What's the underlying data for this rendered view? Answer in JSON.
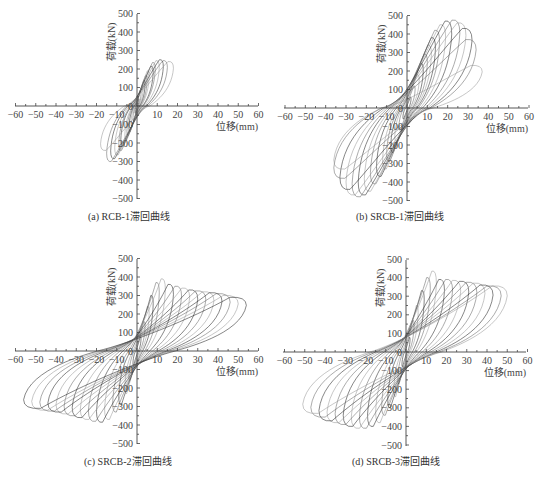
{
  "figure": {
    "captions": [
      "(a) RCB-1滞回曲线",
      "(b) SRCB-1滞回曲线",
      "(c)  SRCB-2滞回曲线",
      "(d) SRCB-3滞回曲线"
    ]
  },
  "chart_data": [
    {
      "type": "line",
      "title": "(a) RCB-1滞回曲线",
      "xlabel": "位移(mm)",
      "ylabel": "荷载(kN)",
      "xlim": [
        -60,
        60
      ],
      "ylim": [
        -500,
        500
      ],
      "xticks": [
        -60,
        -50,
        -40,
        -30,
        -20,
        -10,
        10,
        20,
        30,
        40,
        50,
        60
      ],
      "yticks": [
        -500,
        -400,
        -300,
        -200,
        -100,
        0,
        100,
        200,
        300,
        400,
        500
      ],
      "grid": false,
      "legend": "none",
      "series": [
        {
          "name": "hysteresis",
          "cycles": [
            {
              "dpos": 1,
              "ppos": 40,
              "dneg": -1,
              "pneg": -40
            },
            {
              "dpos": 2,
              "ppos": 80,
              "dneg": -2,
              "pneg": -80
            },
            {
              "dpos": 3,
              "ppos": 110,
              "dneg": -3,
              "pneg": -110
            },
            {
              "dpos": 4,
              "ppos": 140,
              "dneg": -4,
              "pneg": -140
            },
            {
              "dpos": 5,
              "ppos": 165,
              "dneg": -5,
              "pneg": -160
            },
            {
              "dpos": 6,
              "ppos": 190,
              "dneg": -6,
              "pneg": -185
            },
            {
              "dpos": 8,
              "ppos": 215,
              "dneg": -8,
              "pneg": -215
            },
            {
              "dpos": 9,
              "ppos": 235,
              "dneg": -9,
              "pneg": -240
            },
            {
              "dpos": 11,
              "ppos": 245,
              "dneg": -11,
              "pneg": -265
            },
            {
              "dpos": 13,
              "ppos": 250,
              "dneg": -13,
              "pneg": -285
            },
            {
              "dpos": 15,
              "ppos": 245,
              "dneg": -15,
              "pneg": -300
            },
            {
              "dpos": 18,
              "ppos": 240,
              "dneg": -18,
              "pneg": -240
            }
          ]
        }
      ]
    },
    {
      "type": "line",
      "title": "(b) SRCB-1滞回曲线",
      "xlabel": "位移(mm)",
      "ylabel": "荷载(kN)",
      "xlim": [
        -60,
        60
      ],
      "ylim": [
        -500,
        500
      ],
      "xticks": [
        -60,
        -50,
        -40,
        -30,
        -20,
        -10,
        10,
        20,
        30,
        40,
        50,
        60
      ],
      "yticks": [
        -500,
        -400,
        -300,
        -200,
        -100,
        0,
        100,
        200,
        300,
        400,
        500
      ],
      "grid": false,
      "legend": "none",
      "series": [
        {
          "name": "hysteresis",
          "cycles": [
            {
              "dpos": 2,
              "ppos": 60,
              "dneg": -2,
              "pneg": -60
            },
            {
              "dpos": 4,
              "ppos": 120,
              "dneg": -4,
              "pneg": -120
            },
            {
              "dpos": 6,
              "ppos": 180,
              "dneg": -6,
              "pneg": -180
            },
            {
              "dpos": 8,
              "ppos": 240,
              "dneg": -8,
              "pneg": -240
            },
            {
              "dpos": 10,
              "ppos": 290,
              "dneg": -10,
              "pneg": -290
            },
            {
              "dpos": 12,
              "ppos": 340,
              "dneg": -12,
              "pneg": -330
            },
            {
              "dpos": 14,
              "ppos": 380,
              "dneg": -15,
              "pneg": -370
            },
            {
              "dpos": 16,
              "ppos": 420,
              "dneg": -18,
              "pneg": -410
            },
            {
              "dpos": 19,
              "ppos": 450,
              "dneg": -21,
              "pneg": -450
            },
            {
              "dpos": 22,
              "ppos": 470,
              "dneg": -24,
              "pneg": -470
            },
            {
              "dpos": 26,
              "ppos": 475,
              "dneg": -27,
              "pneg": -480
            },
            {
              "dpos": 29,
              "ppos": 460,
              "dneg": -30,
              "pneg": -470
            },
            {
              "dpos": 32,
              "ppos": 430,
              "dneg": -33,
              "pneg": -440
            },
            {
              "dpos": 34,
              "ppos": 370,
              "dneg": -36,
              "pneg": -380
            },
            {
              "dpos": 37,
              "ppos": 230,
              "dneg": -36,
              "pneg": -330
            }
          ]
        }
      ]
    },
    {
      "type": "line",
      "title": "(c)  SRCB-2滞回曲线",
      "xlabel": "位移(mm)",
      "ylabel": "荷载(kN)",
      "xlim": [
        -60,
        60
      ],
      "ylim": [
        -500,
        500
      ],
      "xticks": [
        -60,
        -50,
        -40,
        -30,
        -20,
        -10,
        10,
        20,
        30,
        40,
        50,
        60
      ],
      "yticks": [
        -500,
        -400,
        -300,
        -200,
        -100,
        0,
        100,
        200,
        300,
        400,
        500
      ],
      "grid": false,
      "legend": "none",
      "series": [
        {
          "name": "hysteresis",
          "cycles": [
            {
              "dpos": 2,
              "ppos": 80,
              "dneg": -2,
              "pneg": -80
            },
            {
              "dpos": 4,
              "ppos": 160,
              "dneg": -4,
              "pneg": -160
            },
            {
              "dpos": 6,
              "ppos": 240,
              "dneg": -6,
              "pneg": -230
            },
            {
              "dpos": 8,
              "ppos": 300,
              "dneg": -9,
              "pneg": -290
            },
            {
              "dpos": 11,
              "ppos": 370,
              "dneg": -12,
              "pneg": -330
            },
            {
              "dpos": 14,
              "ppos": 390,
              "dneg": -16,
              "pneg": -370
            },
            {
              "dpos": 18,
              "ppos": 360,
              "dneg": -20,
              "pneg": -385
            },
            {
              "dpos": 22,
              "ppos": 350,
              "dneg": -24,
              "pneg": -380
            },
            {
              "dpos": 26,
              "ppos": 340,
              "dneg": -28,
              "pneg": -370
            },
            {
              "dpos": 30,
              "ppos": 330,
              "dneg": -32,
              "pneg": -360
            },
            {
              "dpos": 34,
              "ppos": 325,
              "dneg": -36,
              "pneg": -350
            },
            {
              "dpos": 38,
              "ppos": 320,
              "dneg": -40,
              "pneg": -340
            },
            {
              "dpos": 42,
              "ppos": 315,
              "dneg": -44,
              "pneg": -330
            },
            {
              "dpos": 46,
              "ppos": 310,
              "dneg": -48,
              "pneg": -325
            },
            {
              "dpos": 50,
              "ppos": 300,
              "dneg": -52,
              "pneg": -320
            },
            {
              "dpos": 54,
              "ppos": 290,
              "dneg": -56,
              "pneg": -310
            }
          ]
        }
      ]
    },
    {
      "type": "line",
      "title": "(d) SRCB-3滞回曲线",
      "xlabel": "位移(mm)",
      "ylabel": "荷载(kN)",
      "xlim": [
        -60,
        60
      ],
      "ylim": [
        -500,
        500
      ],
      "xticks": [
        -60,
        -50,
        -40,
        -30,
        -20,
        -10,
        10,
        20,
        30,
        40,
        50,
        60
      ],
      "yticks": [
        -500,
        -400,
        -300,
        -200,
        -100,
        0,
        100,
        200,
        300,
        400,
        500
      ],
      "grid": false,
      "legend": "none",
      "series": [
        {
          "name": "hysteresis",
          "cycles": [
            {
              "dpos": 2,
              "ppos": 80,
              "dneg": -2,
              "pneg": -80
            },
            {
              "dpos": 4,
              "ppos": 170,
              "dneg": -4,
              "pneg": -170
            },
            {
              "dpos": 6,
              "ppos": 250,
              "dneg": -6,
              "pneg": -240
            },
            {
              "dpos": 9,
              "ppos": 330,
              "dneg": -9,
              "pneg": -300
            },
            {
              "dpos": 12,
              "ppos": 400,
              "dneg": -12,
              "pneg": -340
            },
            {
              "dpos": 15,
              "ppos": 435,
              "dneg": -15,
              "pneg": -380
            },
            {
              "dpos": 19,
              "ppos": 390,
              "dneg": -19,
              "pneg": -400
            },
            {
              "dpos": 23,
              "ppos": 390,
              "dneg": -23,
              "pneg": -410
            },
            {
              "dpos": 27,
              "ppos": 385,
              "dneg": -27,
              "pneg": -410
            },
            {
              "dpos": 31,
              "ppos": 380,
              "dneg": -31,
              "pneg": -400
            },
            {
              "dpos": 35,
              "ppos": 375,
              "dneg": -35,
              "pneg": -390
            },
            {
              "dpos": 39,
              "ppos": 370,
              "dneg": -39,
              "pneg": -380
            },
            {
              "dpos": 43,
              "ppos": 360,
              "dneg": -43,
              "pneg": -370
            },
            {
              "dpos": 47,
              "ppos": 355,
              "dneg": -47,
              "pneg": -350
            },
            {
              "dpos": 50,
              "ppos": 355,
              "dneg": -51,
              "pneg": -330
            }
          ]
        }
      ]
    }
  ]
}
